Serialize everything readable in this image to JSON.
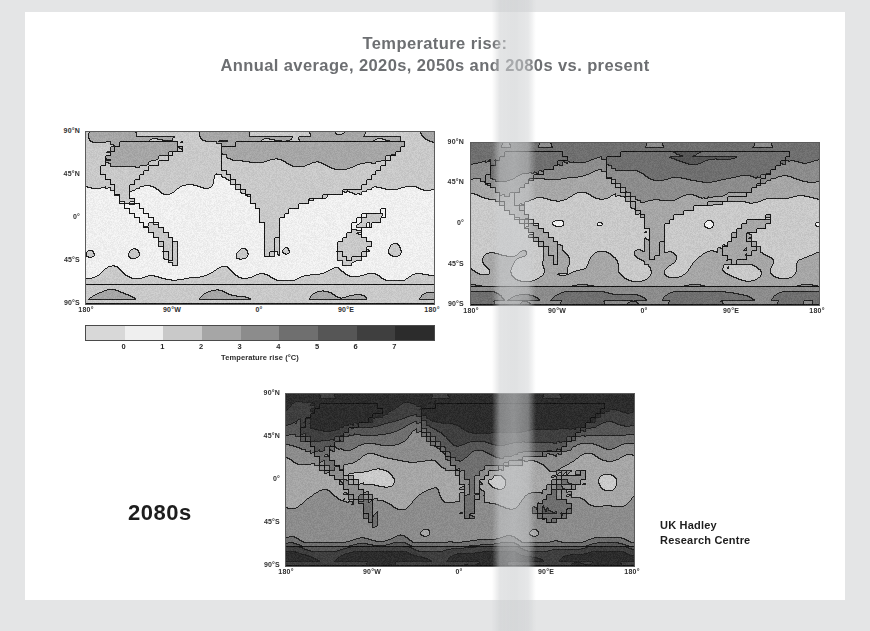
{
  "slide": {
    "background_color": "#ffffff",
    "scan_border_color": "#e4e5e6"
  },
  "title": {
    "line1": "Temperature rise:",
    "line2": "Annual average, 2020s, 2050s and 2080s vs. present",
    "color": "#6d6f72"
  },
  "axes": {
    "y_ticks": [
      "90°N",
      "45°N",
      "0°",
      "45°S",
      "90°S"
    ],
    "x_ticks": [
      "180°",
      "90°W",
      "0°",
      "90°E",
      "180°"
    ]
  },
  "maps": [
    {
      "id": "map-2020s",
      "decade": "2020s",
      "position": "top-left",
      "mean_rise_c": 1.1
    },
    {
      "id": "map-2050s",
      "decade": "2050s",
      "position": "top-right",
      "mean_rise_c": 2.4
    },
    {
      "id": "map-2080s",
      "decade": "2080s",
      "position": "bottom-center",
      "mean_rise_c": 4.2
    }
  ],
  "colorbar": {
    "caption": "Temperature rise (°C)",
    "ticks": [
      "0",
      "1",
      "2",
      "3",
      "4",
      "5",
      "6",
      "7"
    ],
    "min": -1,
    "max": 8,
    "swatches": [
      "#d8d8d8",
      "#efefef",
      "#c9c9c9",
      "#a6a6a6",
      "#8c8c8c",
      "#6f6f6f",
      "#565656",
      "#3f3f3f",
      "#2c2c2c"
    ]
  },
  "annotations": {
    "decade_label": "2080s",
    "credit_line1": "UK Hadley",
    "credit_line2": "Research Centre"
  },
  "chart_data": {
    "type": "heatmap",
    "title": "Temperature rise: Annual average, 2020s, 2050s and 2080s vs. present",
    "xlabel": "",
    "ylabel": "",
    "unit": "°C",
    "colorbar_label": "Temperature rise (°C)",
    "colorbar_ticks": [
      0,
      1,
      2,
      3,
      4,
      5,
      6,
      7
    ],
    "colorbar_range": [
      -1,
      8
    ],
    "grid": false,
    "legend_position": "below-top-left-panel",
    "x_axis": {
      "tick_labels": [
        "180°",
        "90°W",
        "0°",
        "90°E",
        "180°"
      ],
      "tick_values": [
        -180,
        -90,
        0,
        90,
        180
      ],
      "range": [
        -180,
        180
      ]
    },
    "y_axis": {
      "tick_labels": [
        "90°N",
        "45°N",
        "0°",
        "45°S",
        "90°S"
      ],
      "tick_values": [
        90,
        45,
        0,
        -45,
        -90
      ],
      "range": [
        -90,
        90
      ]
    },
    "panels": [
      {
        "name": "2020s",
        "global_mean": 1.1,
        "zonal_means": [
          {
            "lat": 90,
            "value": 2.0
          },
          {
            "lat": 60,
            "value": 1.6
          },
          {
            "lat": 30,
            "value": 1.2
          },
          {
            "lat": 0,
            "value": 1.0
          },
          {
            "lat": -30,
            "value": 0.8
          },
          {
            "lat": -60,
            "value": 0.6
          },
          {
            "lat": -90,
            "value": 0.9
          }
        ]
      },
      {
        "name": "2050s",
        "global_mean": 2.4,
        "zonal_means": [
          {
            "lat": 90,
            "value": 4.5
          },
          {
            "lat": 60,
            "value": 3.4
          },
          {
            "lat": 30,
            "value": 2.6
          },
          {
            "lat": 0,
            "value": 2.2
          },
          {
            "lat": -30,
            "value": 1.8
          },
          {
            "lat": -60,
            "value": 1.3
          },
          {
            "lat": -90,
            "value": 1.9
          }
        ]
      },
      {
        "name": "2080s",
        "global_mean": 4.2,
        "zonal_means": [
          {
            "lat": 90,
            "value": 7.5
          },
          {
            "lat": 60,
            "value": 5.8
          },
          {
            "lat": 30,
            "value": 4.5
          },
          {
            "lat": 0,
            "value": 3.8
          },
          {
            "lat": -30,
            "value": 3.1
          },
          {
            "lat": -60,
            "value": 2.2
          },
          {
            "lat": -90,
            "value": 3.4
          }
        ]
      }
    ]
  }
}
